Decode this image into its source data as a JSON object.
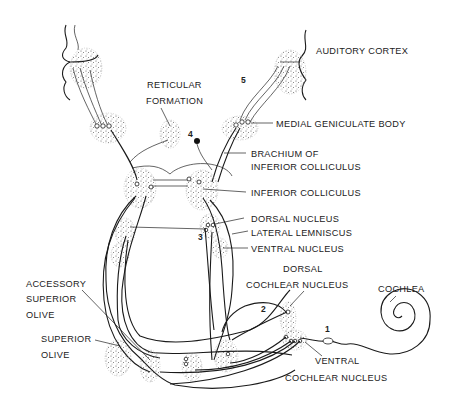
{
  "diagram": {
    "labels": {
      "auditory_cortex": "AUDITORY CORTEX",
      "reticular_formation_1": "RETICULAR",
      "reticular_formation_2": "FORMATION",
      "medial_geniculate_body": "MEDIAL GENICULATE BODY",
      "brachium_1": "BRACHIUM OF",
      "brachium_2": "INFERIOR COLLICULUS",
      "inferior_colliculus": "INFERIOR COLLICULUS",
      "dorsal_nucleus": "DORSAL NUCLEUS",
      "lateral_lemniscus": "LATERAL LEMNISCUS",
      "ventral_nucleus": "VENTRAL NUCLEUS",
      "dorsal_cochlear_1": "DORSAL",
      "dorsal_cochlear_2": "COCHLEAR NUCLEUS",
      "cochlea": "COCHLEA",
      "accessory_superior_olive_1": "ACCESSORY",
      "accessory_superior_olive_2": "SUPERIOR",
      "accessory_superior_olive_3": "OLIVE",
      "superior_olive_1": "SUPERIOR",
      "superior_olive_2": "OLIVE",
      "ventral_cochlear_1": "VENTRAL",
      "ventral_cochlear_2": "COCHLEAR NUCLEUS"
    },
    "numbers": {
      "n1": "1",
      "n2": "2",
      "n3": "3",
      "n4": "4",
      "n5": "5"
    },
    "colors": {
      "line": "#1a1a1a",
      "stipple": "#555555",
      "background": "#ffffff"
    }
  }
}
